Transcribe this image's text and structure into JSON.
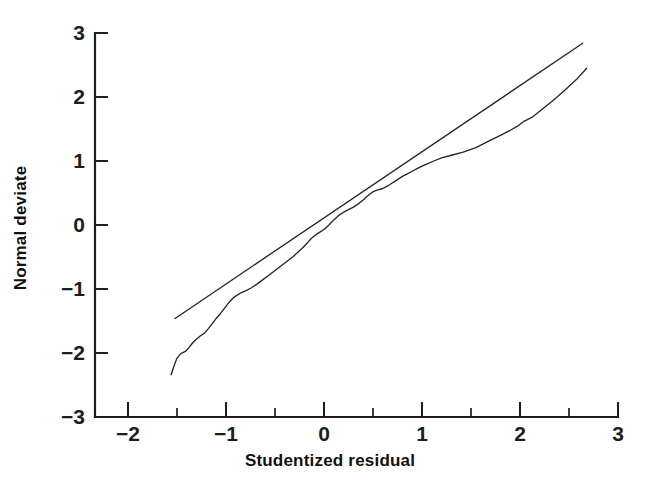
{
  "figure": {
    "background": "#ffffff",
    "ink_color": "#262626"
  },
  "chart_data": {
    "type": "line",
    "title": "",
    "subtitle": "",
    "xlabel": "Studentized residual",
    "ylabel": "Normal deviate",
    "xlim": [
      -2.36,
      3.0
    ],
    "ylim": [
      -3,
      3
    ],
    "grid": false,
    "legend": null,
    "legend_position": "none",
    "x_ticks": [
      -2,
      -1,
      0,
      1,
      2,
      3
    ],
    "x_tick_labels": [
      "−2",
      "−1",
      "0",
      "1",
      "2",
      "3"
    ],
    "x_minor_ticks": [
      -1.5,
      -0.5,
      0.5,
      1.5,
      2.5
    ],
    "y_ticks": [
      -3,
      -2,
      -1,
      0,
      1,
      2,
      3
    ],
    "y_tick_labels": [
      "−3",
      "−2",
      "−1",
      "0",
      "1",
      "2",
      "3"
    ],
    "y_minor_ticks": [],
    "axis_style": "left-and-bottom-spines-ticks-inward",
    "series": [
      {
        "name": "reference-line",
        "style": "straight",
        "x": [
          -1.52,
          2.64
        ],
        "values": [
          -1.46,
          2.84
        ]
      },
      {
        "name": "normal-probability-curve",
        "style": "empirical",
        "x": [
          -1.56,
          -1.53,
          -1.5,
          -1.46,
          -1.41,
          -1.38,
          -1.34,
          -1.3,
          -1.26,
          -1.22,
          -1.18,
          -1.14,
          -1.1,
          -1.06,
          -1.02,
          -0.97,
          -0.92,
          -0.86,
          -0.8,
          -0.74,
          -0.68,
          -0.62,
          -0.56,
          -0.5,
          -0.44,
          -0.38,
          -0.32,
          -0.27,
          -0.22,
          -0.17,
          -0.13,
          -0.09,
          -0.05,
          0.0,
          0.05,
          0.1,
          0.15,
          0.2,
          0.25,
          0.3,
          0.35,
          0.4,
          0.45,
          0.5,
          0.55,
          0.6,
          0.65,
          0.7,
          0.75,
          0.8,
          0.85,
          0.9,
          0.95,
          1.0,
          1.06,
          1.12,
          1.2,
          1.3,
          1.42,
          1.55,
          1.68,
          1.8,
          1.9,
          1.98,
          2.04,
          2.12,
          2.22,
          2.34,
          2.46,
          2.58,
          2.68
        ],
        "values": [
          -2.34,
          -2.2,
          -2.08,
          -2.01,
          -1.97,
          -1.92,
          -1.84,
          -1.78,
          -1.73,
          -1.69,
          -1.62,
          -1.54,
          -1.46,
          -1.39,
          -1.31,
          -1.21,
          -1.13,
          -1.07,
          -1.03,
          -0.98,
          -0.92,
          -0.85,
          -0.78,
          -0.71,
          -0.64,
          -0.57,
          -0.5,
          -0.43,
          -0.36,
          -0.28,
          -0.21,
          -0.16,
          -0.12,
          -0.07,
          0.0,
          0.08,
          0.15,
          0.2,
          0.24,
          0.28,
          0.33,
          0.39,
          0.46,
          0.52,
          0.55,
          0.57,
          0.61,
          0.66,
          0.71,
          0.76,
          0.8,
          0.84,
          0.88,
          0.92,
          0.96,
          1.0,
          1.05,
          1.09,
          1.14,
          1.21,
          1.31,
          1.4,
          1.48,
          1.55,
          1.62,
          1.68,
          1.8,
          1.95,
          2.11,
          2.28,
          2.45
        ]
      }
    ]
  }
}
